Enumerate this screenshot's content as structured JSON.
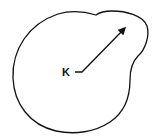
{
  "diagram": {
    "label": "K",
    "stroke_color": "#111111",
    "background": "#ffffff",
    "shape": "closed-blob-with-bulge",
    "arrow": "from-label-to-bulge"
  }
}
